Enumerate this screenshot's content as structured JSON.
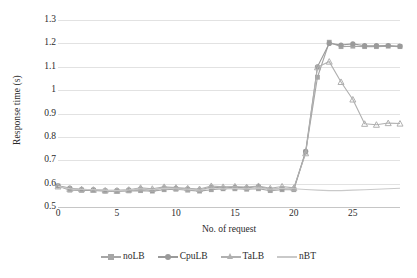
{
  "chart_data": {
    "type": "line",
    "title": "",
    "xlabel": "No. of request",
    "ylabel": "Response time (s)",
    "xlim": [
      0,
      29
    ],
    "ylim": [
      0.5,
      1.3
    ],
    "yticks": [
      0.5,
      0.6,
      0.7,
      0.8,
      0.9,
      1,
      1.1,
      1.2,
      1.3
    ],
    "ytick_labels": [
      "0.5",
      "0.6",
      "0.7",
      "0.8",
      "0.9",
      "1",
      "1.1",
      "1.2",
      "1.3"
    ],
    "xticks": [
      0,
      5,
      10,
      15,
      20,
      25
    ],
    "xtick_labels": [
      "0",
      "5",
      "10",
      "15",
      "20",
      "25"
    ],
    "grid": "horizontal",
    "legend_position": "bottom",
    "x": [
      0,
      1,
      2,
      3,
      4,
      5,
      6,
      7,
      8,
      9,
      10,
      11,
      12,
      13,
      14,
      15,
      16,
      17,
      18,
      19,
      20,
      21,
      22,
      23,
      24,
      25,
      26,
      27,
      28,
      29
    ],
    "series": [
      {
        "name": "noLB",
        "marker": "square",
        "color": "#a6a6a6",
        "values": [
          0.59,
          0.572,
          0.571,
          0.571,
          0.568,
          0.566,
          0.569,
          0.57,
          0.568,
          0.574,
          0.576,
          0.572,
          0.568,
          0.574,
          0.578,
          0.578,
          0.576,
          0.578,
          0.57,
          0.574,
          0.574,
          0.735,
          1.055,
          1.205,
          1.186,
          1.188,
          1.186,
          1.186,
          1.188,
          1.186
        ]
      },
      {
        "name": "CpuLB",
        "marker": "circle",
        "color": "#9a9a9a",
        "values": [
          0.591,
          0.581,
          0.575,
          0.574,
          0.57,
          0.571,
          0.573,
          0.578,
          0.572,
          0.582,
          0.58,
          0.578,
          0.573,
          0.585,
          0.581,
          0.584,
          0.582,
          0.588,
          0.576,
          0.58,
          0.578,
          0.738,
          1.1,
          1.2,
          1.193,
          1.198,
          1.19,
          1.19,
          1.191,
          1.188
        ]
      },
      {
        "name": "TaLB",
        "marker": "triangle",
        "color": "#b0b0b0",
        "values": [
          0.588,
          0.578,
          0.576,
          0.574,
          0.571,
          0.57,
          0.574,
          0.582,
          0.578,
          0.586,
          0.583,
          0.58,
          0.577,
          0.59,
          0.586,
          0.588,
          0.585,
          0.59,
          0.58,
          0.588,
          0.582,
          0.73,
          1.098,
          1.122,
          1.035,
          0.96,
          0.856,
          0.852,
          0.859,
          0.857
        ]
      },
      {
        "name": "nBT",
        "marker": "none",
        "color": "#c9c9c9",
        "values": [
          0.589,
          0.578,
          0.576,
          0.574,
          0.572,
          0.57,
          0.573,
          0.578,
          0.574,
          0.58,
          0.578,
          0.576,
          0.572,
          0.581,
          0.578,
          0.58,
          0.578,
          0.582,
          0.576,
          0.58,
          0.578,
          0.575,
          0.572,
          0.57,
          0.57,
          0.572,
          0.574,
          0.576,
          0.578,
          0.58
        ]
      }
    ]
  },
  "legend": {
    "items": [
      {
        "label": "noLB"
      },
      {
        "label": "CpuLB"
      },
      {
        "label": "TaLB"
      },
      {
        "label": "nBT"
      }
    ]
  }
}
